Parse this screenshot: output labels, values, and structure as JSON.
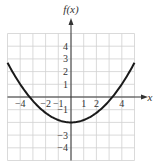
{
  "chart_data": {
    "type": "line",
    "title": "",
    "xlabel": "x",
    "ylabel": "f(x)",
    "xlim": [
      -5,
      5
    ],
    "ylim": [
      -5,
      5
    ],
    "grid": true,
    "x_tick_labels": [
      "−4",
      "−2",
      "−1",
      "1",
      "2",
      "4"
    ],
    "x_tick_values": [
      -4,
      -2,
      -1,
      1,
      2,
      4
    ],
    "y_tick_labels": [
      "4",
      "3",
      "2",
      "1",
      "−1",
      "−3",
      "−4"
    ],
    "y_tick_values": [
      4,
      3,
      2,
      1,
      -1,
      -3,
      -4
    ],
    "series": [
      {
        "name": "f(x)",
        "description": "Upward-opening parabola with vertex at (0, -2), x-intercepts near ±3.3",
        "x": [
          -5,
          -4,
          -3,
          -2,
          -1,
          0,
          1,
          2,
          3,
          4,
          5
        ],
        "values": [
          2.7,
          1.0,
          -0.3,
          -1.25,
          -1.8,
          -2.0,
          -1.8,
          -1.25,
          -0.3,
          1.0,
          2.7
        ]
      }
    ],
    "colors": {
      "curve": "#1a1a1a",
      "grid": "#d0d0d0",
      "axis": "#333333"
    }
  }
}
